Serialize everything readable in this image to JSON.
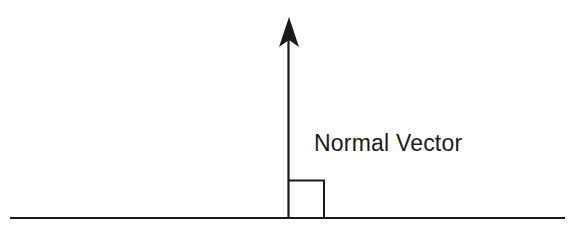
{
  "diagram": {
    "type": "normal-vector-illustration",
    "label": "Normal Vector",
    "elements": {
      "surface_line": {
        "x1": 10,
        "y1": 218,
        "x2": 565,
        "y2": 218
      },
      "vector_shaft": {
        "x": 288,
        "y_top": 40,
        "y_bottom": 218
      },
      "arrowhead": {
        "tip_x": 289,
        "tip_y": 17,
        "half_width": 10,
        "base_y": 46,
        "notch_y": 40
      },
      "right_angle_marker": {
        "x": 288,
        "y": 180,
        "width": 36,
        "height": 38
      }
    },
    "colors": {
      "stroke": "#1a1a1a",
      "background": "#ffffff"
    }
  }
}
